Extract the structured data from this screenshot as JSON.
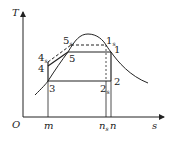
{
  "diagram": {
    "type": "T-s diagram (vapor compression cycle)",
    "axes": {
      "y_label": "T",
      "x_label": "s",
      "origin_label": "O"
    },
    "x_ticks": [
      {
        "label": "m",
        "sub": ""
      },
      {
        "label": "n",
        "sub": "s"
      },
      {
        "label": "n",
        "sub": ""
      }
    ],
    "points": [
      {
        "id": "1",
        "label": "1",
        "sub": ""
      },
      {
        "id": "1s",
        "label": "1",
        "sub": "s"
      },
      {
        "id": "2",
        "label": "2",
        "sub": ""
      },
      {
        "id": "2s",
        "label": "2",
        "sub": "s"
      },
      {
        "id": "3",
        "label": "3",
        "sub": ""
      },
      {
        "id": "4",
        "label": "4",
        "sub": ""
      },
      {
        "id": "4s",
        "label": "4",
        "sub": "s"
      },
      {
        "id": "5",
        "label": "5",
        "sub": ""
      },
      {
        "id": "5s",
        "label": "5",
        "sub": "s"
      }
    ],
    "colors": {
      "line": "#222222",
      "background": "#ffffff"
    }
  }
}
